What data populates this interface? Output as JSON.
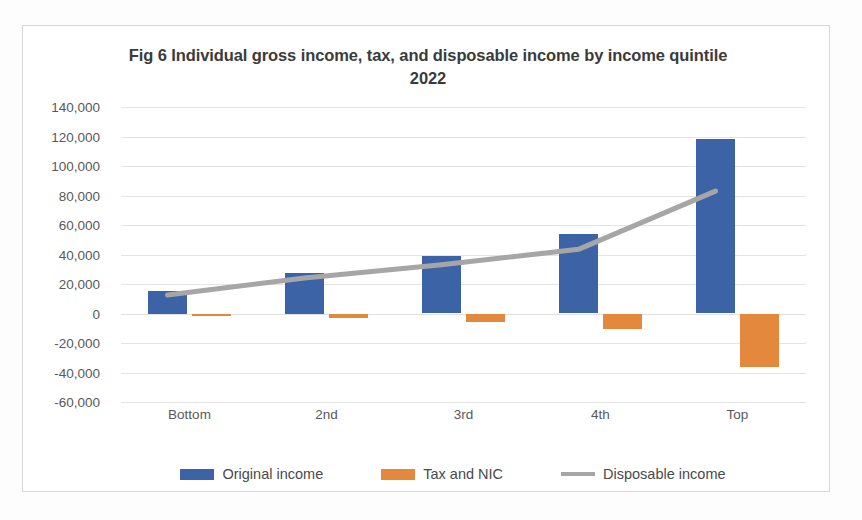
{
  "figure": {
    "title": "Fig 6 Individual gross income, tax, and disposable income by income quintile 2022"
  },
  "legend": {
    "items": [
      {
        "label": "Original income",
        "color": "#3b63a6",
        "marker": "square"
      },
      {
        "label": "Tax and NIC",
        "color": "#e3883c",
        "marker": "square"
      },
      {
        "label": "Disposable income",
        "color": "#a6a6a6",
        "marker": "line"
      }
    ]
  },
  "axes": {
    "y_ticks": [
      "140,000",
      "120,000",
      "100,000",
      "80,000",
      "60,000",
      "40,000",
      "20,000",
      "0",
      "-20,000",
      "-40,000",
      "-60,000"
    ],
    "x_ticks": [
      "Bottom",
      "2nd",
      "3rd",
      "4th",
      "Top"
    ]
  },
  "chart_data": {
    "type": "bar",
    "title": "Fig 6 Individual gross income, tax, and disposable income by income quintile 2022",
    "xlabel": "",
    "ylabel": "",
    "categories": [
      "Bottom",
      "2nd",
      "3rd",
      "4th",
      "Top"
    ],
    "ylim": [
      -60000,
      140000
    ],
    "ytick_step": 20000,
    "grid": true,
    "legend_position": "bottom",
    "series": [
      {
        "name": "Original income",
        "type": "bar",
        "color": "#3b63a6",
        "values": [
          15000,
          27500,
          39000,
          54000,
          118000
        ]
      },
      {
        "name": "Tax and NIC",
        "type": "bar",
        "color": "#e3883c",
        "values": [
          -1500,
          -3000,
          -6000,
          -10500,
          -36000
        ]
      },
      {
        "name": "Disposable income",
        "type": "line",
        "color": "#a6a6a6",
        "values": [
          12500,
          24000,
          33000,
          43500,
          83000
        ]
      }
    ]
  }
}
